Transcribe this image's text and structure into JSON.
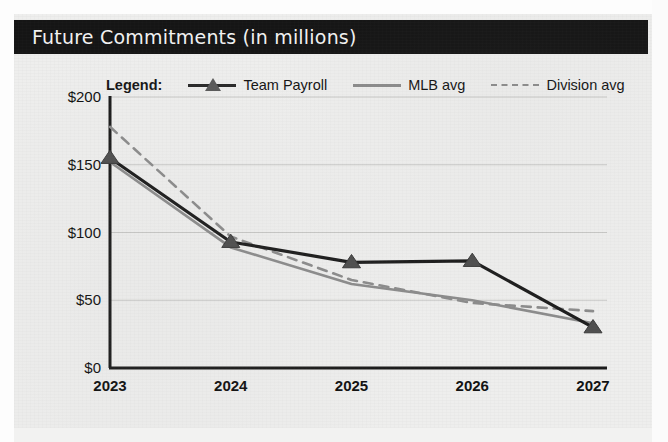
{
  "card": {
    "title": "Future Commitments (in millions)"
  },
  "legend": {
    "title": "Legend:",
    "items": [
      {
        "label": "Team Payroll",
        "style": "solid-marker",
        "color": "#1d1d1d",
        "marker": "triangle-marker"
      },
      {
        "label": "MLB avg",
        "style": "solid",
        "color": "#8c8c8c",
        "marker": "none"
      },
      {
        "label": "Division avg",
        "style": "dashed",
        "color": "#8c8c8c",
        "marker": "none"
      }
    ]
  },
  "chart_data": {
    "type": "line",
    "title": "Future Commitments (in millions)",
    "xlabel": "",
    "ylabel": "",
    "x": [
      "2023",
      "2024",
      "2025",
      "2026",
      "2027"
    ],
    "categories": [
      "2023",
      "2024",
      "2025",
      "2026",
      "2027"
    ],
    "ylim": [
      0,
      200
    ],
    "yticks": [
      0,
      50,
      100,
      150,
      200
    ],
    "ytick_labels": [
      "$0",
      "$50",
      "$100",
      "$150",
      "$200"
    ],
    "xtick_labels": [
      "2023",
      "2024",
      "2025",
      "2026",
      "2027"
    ],
    "grid": true,
    "grid_axis": "y",
    "legend_position": "top",
    "series": [
      {
        "name": "Team Payroll",
        "color": "#1d1d1d",
        "style": "solid",
        "marker": "triangle",
        "values": [
          155,
          93,
          78,
          79,
          30
        ]
      },
      {
        "name": "MLB avg",
        "color": "#8c8c8c",
        "style": "solid",
        "marker": "none",
        "values": [
          152,
          89,
          62,
          50,
          33
        ]
      },
      {
        "name": "Division avg",
        "color": "#8c8c8c",
        "style": "dashed",
        "marker": "none",
        "values": [
          178,
          97,
          65,
          48,
          42
        ]
      }
    ]
  }
}
